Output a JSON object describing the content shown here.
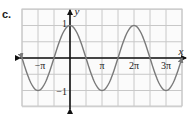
{
  "part_label": "c.",
  "chart_data": {
    "type": "line",
    "title": "",
    "function": "y = cos(x)",
    "xlabel": "x",
    "ylabel": "y",
    "xlim": [
      -1.5,
      3.5
    ],
    "xlim_units": "pi",
    "ylim": [
      -1.5,
      1.5
    ],
    "grid": true,
    "grid_step_x": "pi/2",
    "grid_step_y": 0.5,
    "x_tick_labels": [
      "−π",
      "π",
      "2π",
      "3π"
    ],
    "x_tick_values_pi": [
      -1,
      1,
      2,
      3
    ],
    "y_tick_labels": [
      "1",
      "−1"
    ],
    "y_tick_values": [
      1,
      -1
    ],
    "series": [
      {
        "name": "cos(x)",
        "x_pi": [
          -1.5,
          -1,
          -0.5,
          0,
          0.5,
          1,
          1.5,
          2,
          2.5,
          3,
          3.5
        ],
        "values": [
          0,
          -1,
          0,
          1,
          0,
          -1,
          0,
          1,
          0,
          -1,
          0
        ]
      }
    ],
    "colors": {
      "curve": "#7a7a7a",
      "grid": "#c8c8c8",
      "axes": "#111111"
    },
    "arrows": "both ends of curve and axes"
  }
}
